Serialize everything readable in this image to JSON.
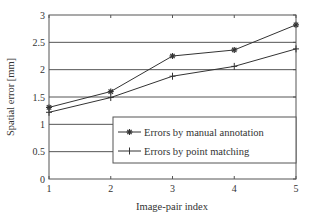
{
  "chart_data": {
    "type": "line",
    "title": "",
    "xlabel": "Image-pair index",
    "ylabel": "Spatial error [mm]",
    "x": [
      1,
      2,
      3,
      4,
      5
    ],
    "xlim": [
      1,
      5
    ],
    "ylim": [
      0,
      3
    ],
    "xticks": [
      "1",
      "2",
      "3",
      "4",
      "5"
    ],
    "yticks": [
      "0",
      "0.5",
      "1",
      "1.5",
      "2",
      "2.5",
      "3"
    ],
    "ytick_values": [
      0,
      0.5,
      1,
      1.5,
      2,
      2.5,
      3
    ],
    "grid": "horizontal",
    "legend_position": "lower right (inside)",
    "series": [
      {
        "name": "Errors by manual annotation",
        "marker": "asterisk",
        "values": [
          1.31,
          1.6,
          2.25,
          2.36,
          2.82
        ]
      },
      {
        "name": "Errors by point matching",
        "marker": "plus",
        "values": [
          1.22,
          1.49,
          1.88,
          2.06,
          2.38
        ]
      }
    ]
  },
  "colors": {
    "line": "#333333",
    "grid": "#555555",
    "axis": "#555555"
  }
}
